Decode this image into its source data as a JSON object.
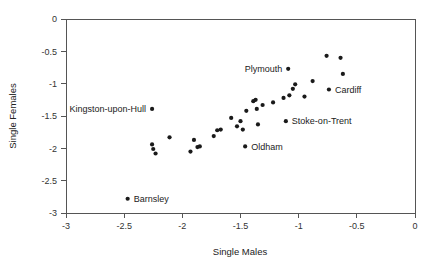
{
  "chart_data": {
    "type": "scatter",
    "title": "",
    "xlabel": "Single Males",
    "ylabel": "Single Females",
    "xlim": [
      -3,
      0
    ],
    "ylim": [
      -3,
      0
    ],
    "grid": false,
    "legend": false,
    "xticks": [
      "-3",
      "-2.5",
      "-2",
      "-1.5",
      "-1",
      "-0.5",
      "0"
    ],
    "xtick_values": [
      -3,
      -2.5,
      -2,
      -1.5,
      -1,
      -0.5,
      0
    ],
    "yticks": [
      "0",
      "-0.5",
      "-1",
      "-1.5",
      "-2",
      "-2.5",
      "-3"
    ],
    "ytick_values": [
      0,
      -0.5,
      -1,
      -1.5,
      -2,
      -2.5,
      -3
    ],
    "points": [
      {
        "x": -2.47,
        "y": -2.78,
        "label": "Barnsley",
        "label_pos": "right"
      },
      {
        "x": -2.26,
        "y": -1.39,
        "label": "Kingston-upon-Hull",
        "label_pos": "left"
      },
      {
        "x": -2.26,
        "y": -1.94,
        "label": "",
        "label_pos": ""
      },
      {
        "x": -2.25,
        "y": -2.01,
        "label": "",
        "label_pos": ""
      },
      {
        "x": -2.23,
        "y": -2.08,
        "label": "",
        "label_pos": ""
      },
      {
        "x": -2.11,
        "y": -1.83,
        "label": "",
        "label_pos": ""
      },
      {
        "x": -1.93,
        "y": -2.05,
        "label": "",
        "label_pos": ""
      },
      {
        "x": -1.9,
        "y": -1.87,
        "label": "",
        "label_pos": ""
      },
      {
        "x": -1.87,
        "y": -1.98,
        "label": "",
        "label_pos": ""
      },
      {
        "x": -1.85,
        "y": -1.97,
        "label": "",
        "label_pos": ""
      },
      {
        "x": -1.73,
        "y": -1.81,
        "label": "",
        "label_pos": ""
      },
      {
        "x": -1.7,
        "y": -1.72,
        "label": "",
        "label_pos": ""
      },
      {
        "x": -1.67,
        "y": -1.71,
        "label": "",
        "label_pos": ""
      },
      {
        "x": -1.58,
        "y": -1.53,
        "label": "",
        "label_pos": ""
      },
      {
        "x": -1.53,
        "y": -1.66,
        "label": "",
        "label_pos": ""
      },
      {
        "x": -1.5,
        "y": -1.58,
        "label": "",
        "label_pos": ""
      },
      {
        "x": -1.48,
        "y": -1.71,
        "label": "",
        "label_pos": ""
      },
      {
        "x": -1.46,
        "y": -1.97,
        "label": "Oldham",
        "label_pos": "right"
      },
      {
        "x": -1.45,
        "y": -1.42,
        "label": "",
        "label_pos": ""
      },
      {
        "x": -1.39,
        "y": -1.27,
        "label": "",
        "label_pos": ""
      },
      {
        "x": -1.37,
        "y": -1.25,
        "label": "",
        "label_pos": ""
      },
      {
        "x": -1.36,
        "y": -1.39,
        "label": "",
        "label_pos": ""
      },
      {
        "x": -1.35,
        "y": -1.63,
        "label": "",
        "label_pos": ""
      },
      {
        "x": -1.31,
        "y": -1.33,
        "label": "",
        "label_pos": ""
      },
      {
        "x": -1.22,
        "y": -1.29,
        "label": "",
        "label_pos": ""
      },
      {
        "x": -1.13,
        "y": -1.22,
        "label": "",
        "label_pos": ""
      },
      {
        "x": -1.11,
        "y": -1.58,
        "label": "Stoke-on-Trent",
        "label_pos": "right"
      },
      {
        "x": -1.09,
        "y": -0.77,
        "label": "Plymouth",
        "label_pos": "left"
      },
      {
        "x": -1.08,
        "y": -1.18,
        "label": "",
        "label_pos": ""
      },
      {
        "x": -1.05,
        "y": -1.08,
        "label": "",
        "label_pos": ""
      },
      {
        "x": -1.03,
        "y": -1.01,
        "label": "",
        "label_pos": ""
      },
      {
        "x": -0.95,
        "y": -1.2,
        "label": "",
        "label_pos": ""
      },
      {
        "x": -0.88,
        "y": -0.96,
        "label": "",
        "label_pos": ""
      },
      {
        "x": -0.76,
        "y": -0.57,
        "label": "",
        "label_pos": ""
      },
      {
        "x": -0.74,
        "y": -1.09,
        "label": "Cardiff",
        "label_pos": "right"
      },
      {
        "x": -0.64,
        "y": -0.6,
        "label": "",
        "label_pos": ""
      },
      {
        "x": -0.62,
        "y": -0.85,
        "label": "",
        "label_pos": ""
      }
    ],
    "labeled_cities": [
      "Barnsley",
      "Kingston-upon-Hull",
      "Oldham",
      "Stoke-on-Trent",
      "Plymouth",
      "Cardiff"
    ],
    "colors": {
      "point": "#1a1a1a",
      "axis": "#555555",
      "text": "#222222",
      "background": "#ffffff"
    }
  }
}
